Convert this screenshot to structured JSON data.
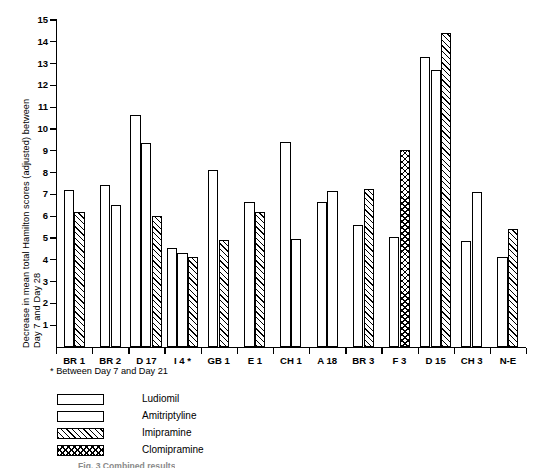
{
  "chart_data": {
    "type": "bar",
    "title": "",
    "xlabel": "",
    "ylabel": "Decrease in mean total Hamilton scores (adjusted) between Day 7 and Day 28",
    "ylabel_lines": [
      "Decrease in mean total Hamilton scores (adjusted) between",
      "Day 7 and Day 28"
    ],
    "ylim": [
      0,
      15
    ],
    "ytick_labels": [
      "1",
      "2",
      "3",
      "4",
      "5",
      "6",
      "7",
      "8",
      "9",
      "10",
      "11",
      "12",
      "13",
      "14",
      "15"
    ],
    "ytick_values": [
      1,
      2,
      3,
      4,
      5,
      6,
      7,
      8,
      9,
      10,
      11,
      12,
      13,
      14,
      15
    ],
    "grid": false,
    "legend_position": "below-left",
    "categories": [
      "BR 1",
      "BR 2",
      "D 17",
      "I 4 *",
      "GB 1",
      "E 1",
      "CH 1",
      "A 18",
      "BR 3",
      "F 3",
      "D 15",
      "CH 3",
      "N-E"
    ],
    "series": [
      {
        "name": "Ludiomil",
        "pattern": "open",
        "values": [
          7.2,
          7.45,
          10.65,
          4.55,
          8.1,
          6.65,
          9.4,
          6.65,
          5.6,
          5.05,
          13.3,
          4.85,
          null
        ]
      },
      {
        "name": "Amitriptyline",
        "pattern": "dotted",
        "values": [
          null,
          6.5,
          9.35,
          4.3,
          null,
          null,
          4.95,
          7.15,
          null,
          null,
          12.7,
          7.1,
          4.15
        ]
      },
      {
        "name": "Imipramine",
        "pattern": "diagonal-hatch",
        "values": [
          6.2,
          null,
          6.0,
          4.15,
          4.9,
          6.2,
          null,
          null,
          7.25,
          null,
          14.4,
          null,
          5.4
        ]
      },
      {
        "name": "Clomipramine",
        "pattern": "cross-hatch",
        "values": [
          null,
          null,
          null,
          null,
          null,
          null,
          null,
          null,
          null,
          9.05,
          null,
          null,
          null
        ]
      }
    ],
    "footnote": "* Between Day 7 and Day 21",
    "caption": "Fig. 3  Combined results"
  },
  "legend": {
    "items": [
      {
        "label": "Ludiomil",
        "pattern": "ludiomil"
      },
      {
        "label": "Amitriptyline",
        "pattern": "amitriptyline"
      },
      {
        "label": "Imipramine",
        "pattern": "imipramine"
      },
      {
        "label": "Clomipramine",
        "pattern": "clomipramine"
      }
    ]
  }
}
